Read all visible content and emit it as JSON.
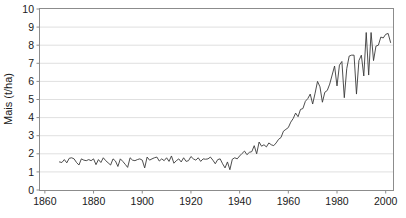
{
  "chart_data": {
    "type": "line",
    "title": "",
    "xlabel": "",
    "ylabel": "Mais (t/ha)",
    "xlim": [
      1858,
      2003
    ],
    "ylim": [
      0,
      10
    ],
    "grid": true,
    "legend": "none",
    "xticks": [
      1860,
      1880,
      1900,
      1920,
      1940,
      1960,
      1980,
      2000
    ],
    "xtick_labels": [
      "1860",
      "1880",
      "1900",
      "1920",
      "1940",
      "1960",
      "1980",
      "2000"
    ],
    "yticks": [
      0,
      1,
      2,
      3,
      4,
      5,
      6,
      7,
      8,
      9,
      10
    ],
    "ytick_labels": [
      "0",
      "1",
      "2",
      "3",
      "4",
      "5",
      "6",
      "7",
      "8",
      "9",
      "10"
    ],
    "series": [
      {
        "name": "Mais",
        "color": "#3a3a3a",
        "x": [
          1866,
          1867,
          1868,
          1869,
          1870,
          1871,
          1872,
          1873,
          1874,
          1875,
          1876,
          1877,
          1878,
          1879,
          1880,
          1881,
          1882,
          1883,
          1884,
          1885,
          1886,
          1887,
          1888,
          1889,
          1890,
          1891,
          1892,
          1893,
          1894,
          1895,
          1896,
          1897,
          1898,
          1899,
          1900,
          1901,
          1902,
          1903,
          1904,
          1905,
          1906,
          1907,
          1908,
          1909,
          1910,
          1911,
          1912,
          1913,
          1914,
          1915,
          1916,
          1917,
          1918,
          1919,
          1920,
          1921,
          1922,
          1923,
          1924,
          1925,
          1926,
          1927,
          1928,
          1929,
          1930,
          1931,
          1932,
          1933,
          1934,
          1935,
          1936,
          1937,
          1938,
          1939,
          1940,
          1941,
          1942,
          1943,
          1944,
          1945,
          1946,
          1947,
          1948,
          1949,
          1950,
          1951,
          1952,
          1953,
          1954,
          1955,
          1956,
          1957,
          1958,
          1959,
          1960,
          1961,
          1962,
          1963,
          1964,
          1965,
          1966,
          1967,
          1968,
          1969,
          1970,
          1971,
          1972,
          1973,
          1974,
          1975,
          1976,
          1977,
          1978,
          1979,
          1980,
          1981,
          1982,
          1983,
          1984,
          1985,
          1986,
          1987,
          1988,
          1989,
          1990,
          1991,
          1992,
          1993,
          1994,
          1995,
          1996,
          1997,
          1998,
          1999,
          2000,
          2001,
          2002
        ],
        "y": [
          1.55,
          1.52,
          1.68,
          1.5,
          1.75,
          1.78,
          1.72,
          1.52,
          1.38,
          1.72,
          1.65,
          1.62,
          1.68,
          1.62,
          1.72,
          1.4,
          1.68,
          1.52,
          1.78,
          1.62,
          1.5,
          1.38,
          1.72,
          1.6,
          1.3,
          1.72,
          1.58,
          1.42,
          1.25,
          1.78,
          1.65,
          1.62,
          1.68,
          1.72,
          1.65,
          1.22,
          1.82,
          1.65,
          1.72,
          1.78,
          1.82,
          1.6,
          1.72,
          1.62,
          1.78,
          1.58,
          1.88,
          1.48,
          1.62,
          1.72,
          1.55,
          1.78,
          1.58,
          1.62,
          1.85,
          1.72,
          1.65,
          1.78,
          1.58,
          1.72,
          1.7,
          1.72,
          1.82,
          1.65,
          1.45,
          1.68,
          1.72,
          1.45,
          1.22,
          1.55,
          1.12,
          1.7,
          1.78,
          1.72,
          1.88,
          2.02,
          2.15,
          1.95,
          2.08,
          2.12,
          2.45,
          2.0,
          2.65,
          2.42,
          2.5,
          2.38,
          2.6,
          2.5,
          2.45,
          2.6,
          2.8,
          2.9,
          3.25,
          3.35,
          3.45,
          3.75,
          3.95,
          4.25,
          4.05,
          4.45,
          4.5,
          4.9,
          5.05,
          5.3,
          4.75,
          5.35,
          6.0,
          5.7,
          4.85,
          5.4,
          5.5,
          5.85,
          6.35,
          6.85,
          5.75,
          6.9,
          7.1,
          5.1,
          6.7,
          7.4,
          7.45,
          7.45,
          5.3,
          7.15,
          7.45,
          6.3,
          8.7,
          6.35,
          8.7,
          7.15,
          7.95,
          8.0,
          8.45,
          8.4,
          8.6,
          8.65,
          8.15
        ]
      }
    ]
  }
}
